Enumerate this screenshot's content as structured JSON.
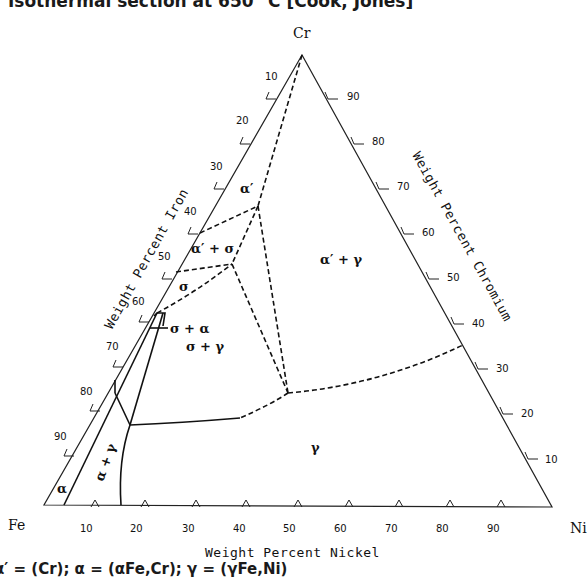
{
  "title": "Isothermal section at 650 °C [Cook, Jones]",
  "caption": "α′ = (Cr); α = (αFe,Cr); γ = (γFe,Ni)",
  "corners": {
    "top": "Cr",
    "left": "Fe",
    "right": "Ni"
  },
  "axes": {
    "left": {
      "title": "Weight Percent Iron",
      "ticks": [
        "10",
        "20",
        "30",
        "40",
        "50",
        "60",
        "70",
        "80",
        "90"
      ]
    },
    "right": {
      "title": "Weight Percent Chromium",
      "ticks": [
        "90",
        "80",
        "70",
        "60",
        "50",
        "40",
        "30",
        "20",
        "10"
      ]
    },
    "bottom": {
      "title": "Weight Percent Nickel",
      "ticks": [
        "10",
        "20",
        "30",
        "40",
        "50",
        "60",
        "70",
        "80",
        "90"
      ]
    }
  },
  "phases": {
    "alpha_prime": "α′",
    "alpha_prime_sigma": "α′ + σ",
    "sigma": "σ",
    "sigma_alpha": "σ + α",
    "sigma_gamma": "σ + γ",
    "alpha_prime_gamma": "α′ + γ",
    "gamma": "γ",
    "alpha_gamma": "α + γ",
    "alpha": "α"
  },
  "colors": {
    "line": "#111111",
    "background": "#ffffff"
  }
}
